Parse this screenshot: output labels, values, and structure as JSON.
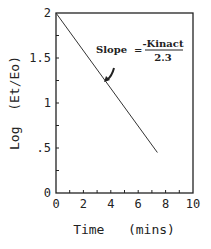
{
  "chart_data": {
    "type": "line",
    "title": "",
    "xlabel": "Time   (mins)",
    "ylabel": "Log  (Et/Eo)",
    "xlim": [
      0,
      10
    ],
    "ylim": [
      0,
      2
    ],
    "x_ticks": [
      "0",
      "2",
      "4",
      "6",
      "8",
      "10"
    ],
    "y_ticks": [
      "0",
      ".5",
      "1",
      "1.5",
      "2"
    ],
    "grid": false,
    "series": [
      {
        "name": "Log(Et/Eo)",
        "x": [
          0,
          7.4
        ],
        "y": [
          2.0,
          0.45
        ]
      }
    ],
    "annotations": [
      {
        "text": "Slope  =",
        "numerator": "-Kinact",
        "denominator": "2.3",
        "arrow_to": [
          3.3,
          1.25
        ]
      }
    ]
  }
}
